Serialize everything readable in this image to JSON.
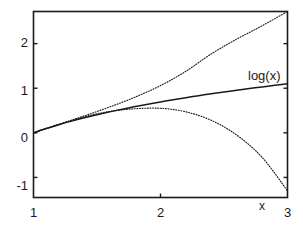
{
  "chart_data": {
    "type": "line",
    "title": "",
    "xlabel": "x",
    "ylabel": "",
    "xlim": [
      1,
      3
    ],
    "ylim": [
      -1.45,
      2.72
    ],
    "grid": false,
    "legend_position": "inline-annotation",
    "xticks": [
      1,
      2,
      3
    ],
    "xtick_labels": [
      "1",
      "2",
      "3"
    ],
    "yticks": [
      -1,
      0,
      1,
      2
    ],
    "ytick_labels": [
      "-1",
      "0",
      "1",
      "2"
    ],
    "annotations": [
      {
        "text": "log(x)",
        "x": 2.62,
        "y": 1.35
      }
    ],
    "series": [
      {
        "name": "log(x)",
        "style": "solid",
        "color": "#1a1a1a",
        "x": [
          1.0,
          1.1,
          1.2,
          1.3,
          1.4,
          1.5,
          1.6,
          1.7,
          1.8,
          1.9,
          2.0,
          2.1,
          2.2,
          2.3,
          2.4,
          2.5,
          2.6,
          2.7,
          2.8,
          2.9,
          3.0
        ],
        "y": [
          0.0,
          0.0953,
          0.1823,
          0.2624,
          0.3365,
          0.4055,
          0.47,
          0.5306,
          0.5878,
          0.6419,
          0.6931,
          0.7419,
          0.7885,
          0.8329,
          0.8755,
          0.9163,
          0.9555,
          0.9933,
          1.0296,
          1.0647,
          1.0986
        ]
      },
      {
        "name": "first-order Taylor: (x-1)",
        "style": "dotted",
        "color": "#1a1a1a",
        "x": [
          1.0,
          1.1,
          1.2,
          1.3,
          1.4,
          1.5,
          1.6,
          1.7,
          1.8,
          1.9,
          2.0,
          2.1,
          2.2,
          2.3,
          2.4,
          2.5,
          2.6,
          2.7,
          2.8,
          2.9,
          3.0
        ],
        "y": [
          0.0,
          0.1,
          0.2,
          0.3,
          0.4,
          0.5,
          0.6,
          0.7,
          0.8,
          0.9,
          1.0,
          1.1,
          1.2,
          1.3,
          1.4,
          1.5,
          1.6,
          1.7,
          1.8,
          1.9,
          2.0
        ]
      },
      {
        "name": "second-order Taylor: (x-1) - (x-1)^2/2",
        "style": "dotted",
        "color": "#1a1a1a",
        "x": [
          1.0,
          1.1,
          1.2,
          1.3,
          1.4,
          1.5,
          1.6,
          1.7,
          1.8,
          1.9,
          2.0,
          2.1,
          2.2,
          2.3,
          2.4,
          2.5,
          2.6,
          2.7,
          2.8,
          2.9,
          3.0
        ],
        "y": [
          0.0,
          0.095,
          0.18,
          0.255,
          0.32,
          0.375,
          0.42,
          0.455,
          0.48,
          0.495,
          0.5,
          0.495,
          0.48,
          0.455,
          0.42,
          0.375,
          0.32,
          0.255,
          0.18,
          0.095,
          0.0
        ]
      },
      {
        "name": "upper-dotted-envelope",
        "style": "dotted",
        "color": "#1a1a1a",
        "x": [
          1.0,
          1.2,
          1.4,
          1.6,
          1.8,
          2.0,
          2.2,
          2.4,
          2.6,
          2.8,
          3.0
        ],
        "y": [
          0.0,
          0.19,
          0.38,
          0.58,
          0.8,
          1.06,
          1.38,
          1.77,
          2.1,
          2.4,
          2.72
        ]
      },
      {
        "name": "lower-dotted-envelope",
        "style": "dotted",
        "color": "#1a1a1a",
        "x": [
          1.0,
          1.2,
          1.4,
          1.6,
          1.8,
          2.0,
          2.2,
          2.4,
          2.6,
          2.8,
          3.0
        ],
        "y": [
          0.0,
          0.19,
          0.36,
          0.48,
          0.54,
          0.55,
          0.47,
          0.28,
          -0.05,
          -0.55,
          -1.3
        ]
      }
    ]
  },
  "axes": {
    "x_axis_label": "x",
    "xtick_1": "1",
    "xtick_2": "2",
    "xtick_3": "3",
    "ytick_neg1": "-1",
    "ytick_0": "0",
    "ytick_1": "1",
    "ytick_2": "2"
  },
  "labels": {
    "log_curve": "log(x)"
  },
  "colors": {
    "background": "#ffffff",
    "axis": "#1a1a1a",
    "curve": "#1a1a1a"
  }
}
